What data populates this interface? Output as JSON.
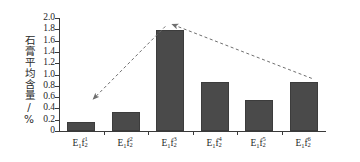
{
  "chart_data": {
    "type": "bar",
    "title": "",
    "xlabel": "",
    "ylabel": "石膏平均含量/%",
    "categories": [
      "E₁f₂¹",
      "E₁f₂²",
      "E₁f₂³",
      "E₁f₂⁴",
      "E₁f₂⁵",
      "E₁f₂⁶"
    ],
    "category_parts": [
      {
        "base": "E",
        "sub1": "1",
        "base2": "f",
        "sup": "1",
        "sub2": "2"
      },
      {
        "base": "E",
        "sub1": "1",
        "base2": "f",
        "sup": "2",
        "sub2": "2"
      },
      {
        "base": "E",
        "sub1": "1",
        "base2": "f",
        "sup": "3",
        "sub2": "2"
      },
      {
        "base": "E",
        "sub1": "1",
        "base2": "f",
        "sup": "4",
        "sub2": "2"
      },
      {
        "base": "E",
        "sub1": "1",
        "base2": "f",
        "sup": "5",
        "sub2": "2"
      },
      {
        "base": "E",
        "sub1": "1",
        "base2": "f",
        "sup": "6",
        "sub2": "2"
      }
    ],
    "values": [
      0.16,
      0.33,
      1.78,
      0.86,
      0.55,
      0.86
    ],
    "ylim": [
      0,
      2.0
    ],
    "ytick_step": 0.2,
    "ytick_labels": [
      "0",
      "0.2",
      "0.4",
      "0.6",
      "0.8",
      "1.0",
      "1.2",
      "1.4",
      "1.6",
      "1.8",
      "2.0"
    ],
    "grid": false,
    "legend": "none",
    "bar_color": "#4a4a4a",
    "axis_color": "#3a3a3a",
    "annotation_color": "#7a7a7a",
    "annotations": [
      {
        "name": "rising-trend-arrow",
        "from": "E₁f₂³",
        "to": "E₁f₂¹",
        "direction": "down-left",
        "style": "dashed"
      },
      {
        "name": "falling-trend-arrow",
        "from": "E₁f₂⁶",
        "to": "E₁f₂³",
        "direction": "up-left",
        "style": "dashed"
      }
    ]
  }
}
